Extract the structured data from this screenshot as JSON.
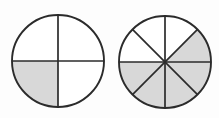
{
  "figure": {
    "background_color": "#fdfdfd",
    "shade_color": "#d8d8d8",
    "empty_color": "#ffffff",
    "line_color": "#2b2b2b",
    "line_width": 1.7,
    "outline_width": 1.9
  },
  "chart_data": {
    "type": "pie",
    "xlabel": "",
    "ylabel": "",
    "grid": false,
    "legend": "none",
    "charts": [
      {
        "name": "left-circle",
        "label": "one quarter",
        "center_x": 58,
        "center_y": 61,
        "radius": 46,
        "total_slices": 4,
        "shaded_slices": 1,
        "fraction": "1/4",
        "value": 0.25,
        "slice_angle_degrees": 90,
        "categories": [
          "top-right",
          "bottom-right",
          "bottom-left",
          "top-left"
        ],
        "values": [
          25,
          25,
          25,
          25
        ],
        "shaded": [
          false,
          false,
          true,
          false
        ]
      },
      {
        "name": "right-circle",
        "label": "five eighths",
        "center_x": 165,
        "center_y": 62,
        "radius": 46,
        "total_slices": 8,
        "shaded_slices": 5,
        "fraction": "5/8",
        "value": 0.625,
        "slice_angle_degrees": 45,
        "categories": [
          "12-to-1:30",
          "1:30-to-3",
          "3-to-4:30",
          "4:30-to-6",
          "6-to-7:30",
          "7:30-to-9",
          "9-to-10:30",
          "10:30-to-12"
        ],
        "values": [
          12.5,
          12.5,
          12.5,
          12.5,
          12.5,
          12.5,
          12.5,
          12.5
        ],
        "shaded": [
          false,
          true,
          true,
          true,
          true,
          true,
          false,
          false
        ]
      }
    ]
  }
}
